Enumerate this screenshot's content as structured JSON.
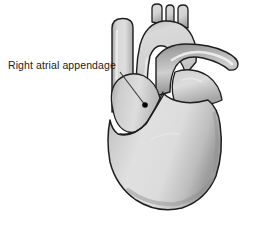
{
  "figure": {
    "background_color": "#ffffff"
  },
  "annotation": {
    "label": "Right atrial appendage",
    "text_color": "#1b1b1b",
    "leader_line_color": "#3a3a44",
    "marker_color": "#000000",
    "marker_point": {
      "x": 145,
      "y": 105
    },
    "leader_start": {
      "x": 120,
      "y": 72
    }
  },
  "anatomy": {
    "outline_color": "#1e1e1e",
    "fill_light": "#e2e2e2",
    "fill_mid": "#cfcfcf",
    "fill_dark": "#9a9a9a",
    "highlight": "#f2f2f2",
    "structures": [
      {
        "name": "superior-vena-cava",
        "label": "Superior vena cava"
      },
      {
        "name": "aortic-arch",
        "label": "Aortic arch"
      },
      {
        "name": "brachiocephalic-trunk",
        "label": "Brachiocephalic trunk"
      },
      {
        "name": "left-common-carotid-artery",
        "label": "Left common carotid artery"
      },
      {
        "name": "left-subclavian-artery",
        "label": "Left subclavian artery"
      },
      {
        "name": "pulmonary-artery",
        "label": "Pulmonary artery"
      },
      {
        "name": "left-atrial-appendage",
        "label": "Left atrial appendage"
      },
      {
        "name": "right-atrium",
        "label": "Right atrium"
      },
      {
        "name": "right-ventricle",
        "label": "Right ventricle"
      },
      {
        "name": "left-ventricle",
        "label": "Left ventricle"
      },
      {
        "name": "atrioventricular-groove",
        "label": "Atrioventricular groove"
      },
      {
        "name": "cardiac-apex",
        "label": "Cardiac apex"
      }
    ]
  }
}
